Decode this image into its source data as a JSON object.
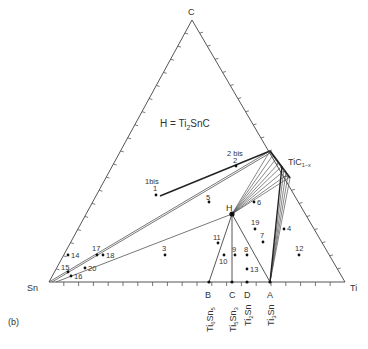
{
  "title": "H = Ti2SnC",
  "legend": {
    "h_prefix": "H = Ti",
    "h_sub": "2",
    "h_suffix": "SnC"
  },
  "panel_label": "(b)",
  "vertices": {
    "top": "C",
    "left": "Sn",
    "right": "Ti"
  },
  "phases": {
    "H": "H",
    "tic": {
      "base": "TiC",
      "sub": "1−x"
    },
    "binary": [
      {
        "letter": "B",
        "formula": [
          "Ti",
          "6",
          "Sn",
          "5"
        ]
      },
      {
        "letter": "C",
        "formula": [
          "Ti",
          "5",
          "Sn",
          "3"
        ]
      },
      {
        "letter": "D",
        "formula": [
          "Ti",
          "2",
          "Sn",
          ""
        ]
      },
      {
        "letter": "A",
        "formula": [
          "Ti",
          "3",
          "Sn",
          ""
        ]
      }
    ]
  },
  "points": [
    {
      "label": "1bis",
      "x": 150,
      "y": 181,
      "dot": false
    },
    {
      "label": "1",
      "x": 156,
      "y": 194,
      "dot": true
    },
    {
      "label": "2 bis",
      "x": 237,
      "y": 154,
      "dot": false
    },
    {
      "label": "2",
      "x": 236,
      "y": 165,
      "dot": true
    },
    {
      "label": "3",
      "x": 165,
      "y": 255,
      "dot": true
    },
    {
      "label": "4",
      "x": 284,
      "y": 229,
      "dot": true
    },
    {
      "label": "5",
      "x": 209,
      "y": 202,
      "dot": true
    },
    {
      "label": "6",
      "x": 254,
      "y": 202,
      "dot": true
    },
    {
      "label": "7",
      "x": 263,
      "y": 242,
      "dot": true
    },
    {
      "label": "8",
      "x": 247,
      "y": 255,
      "dot": true
    },
    {
      "label": "9",
      "x": 235,
      "y": 255,
      "dot": true
    },
    {
      "label": "10",
      "x": 224,
      "y": 255,
      "dot": true
    },
    {
      "label": "11",
      "x": 218,
      "y": 243,
      "dot": true
    },
    {
      "label": "12",
      "x": 299,
      "y": 255,
      "dot": true
    },
    {
      "label": "13",
      "x": 247,
      "y": 269,
      "dot": true
    },
    {
      "label": "14",
      "x": 68,
      "y": 255,
      "dot": true
    },
    {
      "label": "15",
      "x": 68,
      "y": 272,
      "dot": true
    },
    {
      "label": "16",
      "x": 71,
      "y": 276,
      "dot": true
    },
    {
      "label": "17",
      "x": 97,
      "y": 255,
      "dot": true
    },
    {
      "label": "18",
      "x": 103,
      "y": 255,
      "dot": true
    },
    {
      "label": "20",
      "x": 85,
      "y": 268,
      "dot": true
    },
    {
      "label": "19",
      "x": 255,
      "y": 229,
      "dot": true
    }
  ]
}
